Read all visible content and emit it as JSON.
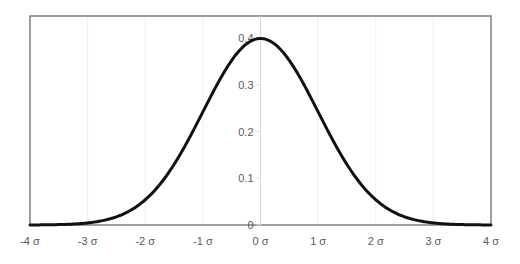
{
  "chart_data": {
    "type": "line",
    "title": "",
    "xlabel": "",
    "ylabel": "",
    "series": [
      {
        "name": "Standard normal density",
        "function": "pdf(x) = exp(-x^2/2)/sqrt(2*pi)",
        "color": "#111111"
      }
    ],
    "x": [
      -4,
      -3,
      -2,
      -1,
      0,
      1,
      2,
      3,
      4
    ],
    "values": [
      0.0001,
      0.0044,
      0.054,
      0.242,
      0.399,
      0.242,
      0.054,
      0.0044,
      0.0001
    ],
    "xlim": [
      -4,
      4
    ],
    "ylim": [
      0,
      0.4
    ],
    "x_tick_labels": [
      "-4 σ",
      "-3 σ",
      "-2 σ",
      "-1 σ",
      "0 σ",
      "1 σ",
      "2 σ",
      "3 σ",
      "4 σ"
    ],
    "y_tick_labels": [
      "0",
      "0.1",
      "0.2",
      "0.3",
      "0.4"
    ],
    "y_ticks": [
      0,
      0.1,
      0.2,
      0.3,
      0.4
    ],
    "grid": {
      "vertical": true,
      "horizontal": false
    },
    "legend": null
  },
  "style": {
    "frame_color": "#7f7f7f",
    "grid_color": "#efefef",
    "axis_color": "#d9d9d9",
    "curve_color": "#111111",
    "label_color": "#595959"
  }
}
